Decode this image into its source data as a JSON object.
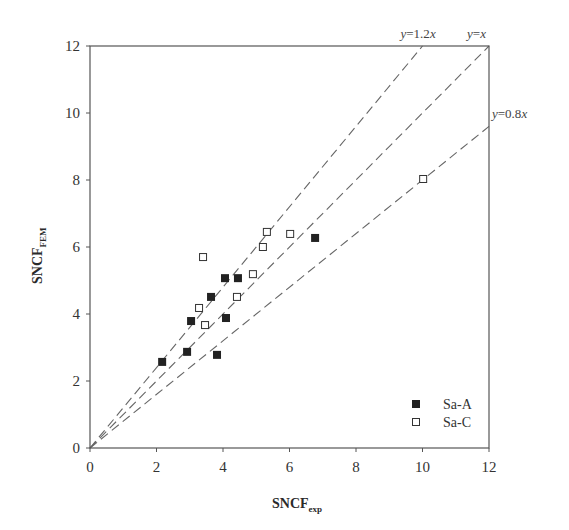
{
  "chart_data": {
    "type": "scatter",
    "title": "",
    "xlabel": "SNCF",
    "xlabel_sub": "exp",
    "ylabel": "SNCF",
    "ylabel_sub": "FEM",
    "xlim": [
      0,
      12
    ],
    "ylim": [
      0,
      12
    ],
    "xticks": [
      0,
      2,
      4,
      6,
      8,
      10,
      12
    ],
    "yticks": [
      0,
      2,
      4,
      6,
      8,
      10,
      12
    ],
    "grid": false,
    "legend_position": "lower right",
    "series": [
      {
        "name": "Sa-A",
        "marker": "filled-square",
        "color": "#222222",
        "points": [
          [
            2.17,
            2.57
          ],
          [
            2.92,
            2.87
          ],
          [
            3.82,
            2.78
          ],
          [
            3.04,
            3.79
          ],
          [
            3.64,
            4.51
          ],
          [
            4.09,
            3.88
          ],
          [
            4.06,
            5.07
          ],
          [
            4.45,
            5.07
          ],
          [
            6.77,
            6.27
          ]
        ]
      },
      {
        "name": "Sa-C",
        "marker": "open-square",
        "color": "#333333",
        "points": [
          [
            3.46,
            3.67
          ],
          [
            3.28,
            4.18
          ],
          [
            4.42,
            4.51
          ],
          [
            3.4,
            5.7
          ],
          [
            4.9,
            5.19
          ],
          [
            5.2,
            6.0
          ],
          [
            5.32,
            6.45
          ],
          [
            6.02,
            6.39
          ],
          [
            10.02,
            8.03
          ]
        ]
      }
    ],
    "reference_lines": [
      {
        "label_prefix": "y",
        "label_eq": "=1.2",
        "label_var": "x",
        "slope": 1.2
      },
      {
        "label_prefix": "y",
        "label_eq": "=",
        "label_var": "x",
        "slope": 1.0
      },
      {
        "label_prefix": "y",
        "label_eq": "=0.8",
        "label_var": "x",
        "slope": 0.8
      }
    ],
    "legend": [
      {
        "label": "Sa-A",
        "marker": "filled-square"
      },
      {
        "label": "Sa-C",
        "marker": "open-square"
      }
    ]
  }
}
